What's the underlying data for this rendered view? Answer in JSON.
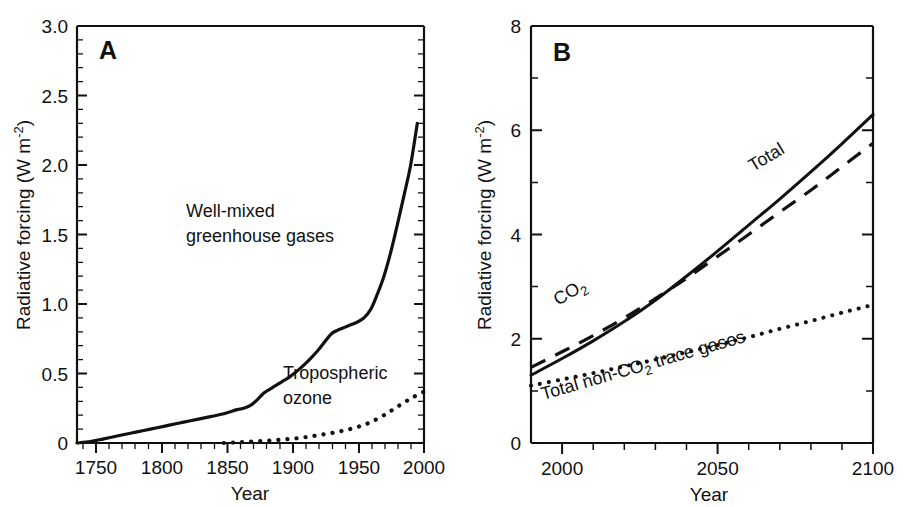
{
  "figure": {
    "background": "#ffffff",
    "ink_color": "#111111",
    "panels": [
      "A",
      "B"
    ]
  },
  "panel_a": {
    "letter": "A",
    "xlabel": "Year",
    "ylabel_main": "Radiative forcing (W m",
    "ylabel_exp": "-2",
    "ylabel_close": ")",
    "ylabel_full": "Radiative forcing (W m-2)",
    "x_ticks": [
      "1750",
      "1800",
      "1850",
      "1900",
      "1950",
      "2000"
    ],
    "y_ticks": [
      "0",
      "0.5",
      "1.0",
      "1.5",
      "2.0",
      "2.5",
      "3.0"
    ],
    "annotations": {
      "ghg_line1": "Well-mixed",
      "ghg_line2": "greenhouse gases",
      "ozone_line1": "Tropospheric",
      "ozone_line2": "ozone"
    }
  },
  "panel_b": {
    "letter": "B",
    "xlabel": "Year",
    "ylabel_main": "Radiative forcing (W m",
    "ylabel_exp": "-2",
    "ylabel_close": ")",
    "ylabel_full": "Radiative forcing (W m-2)",
    "x_ticks": [
      "2000",
      "2050",
      "2100"
    ],
    "y_ticks": [
      "0",
      "2",
      "4",
      "6",
      "8"
    ],
    "annotations": {
      "total": "Total",
      "co2_main": "CO",
      "co2_sub": "2",
      "nonco2_pre": "Total non-CO",
      "nonco2_sub": "2",
      "nonco2_post": " trace gases"
    }
  },
  "chart_data": [
    {
      "type": "line",
      "panel": "A",
      "title": "",
      "xlabel": "Year",
      "ylabel": "Radiative forcing (W m-2)",
      "xlim": [
        1740,
        2000
      ],
      "ylim": [
        0,
        3.0
      ],
      "x_major_ticks": [
        1750,
        1800,
        1850,
        1900,
        1950,
        2000
      ],
      "y_major_ticks": [
        0,
        0.5,
        1.0,
        1.5,
        2.0,
        2.5,
        3.0
      ],
      "x_minor_interval": 10,
      "y_minor_interval": 0.1,
      "grid": false,
      "legend": "inline-annotations",
      "series": [
        {
          "name": "Well-mixed greenhouse gases",
          "style": "solid",
          "x": [
            1740,
            1750,
            1760,
            1770,
            1780,
            1790,
            1800,
            1810,
            1820,
            1830,
            1840,
            1850,
            1860,
            1865,
            1870,
            1875,
            1880,
            1885,
            1890,
            1895,
            1900,
            1910,
            1920,
            1930,
            1935,
            1940,
            1945,
            1950,
            1955,
            1960,
            1965,
            1970,
            1975,
            1980,
            1985,
            1990,
            1995
          ],
          "y": [
            0.0,
            0.01,
            0.03,
            0.05,
            0.07,
            0.09,
            0.11,
            0.13,
            0.15,
            0.17,
            0.19,
            0.21,
            0.24,
            0.25,
            0.27,
            0.31,
            0.36,
            0.39,
            0.42,
            0.45,
            0.48,
            0.56,
            0.66,
            0.78,
            0.81,
            0.83,
            0.85,
            0.87,
            0.9,
            0.96,
            1.07,
            1.2,
            1.37,
            1.57,
            1.78,
            2.0,
            2.3
          ]
        },
        {
          "name": "Tropospheric ozone",
          "style": "dotted",
          "x": [
            1850,
            1860,
            1870,
            1880,
            1890,
            1900,
            1910,
            1920,
            1930,
            1940,
            1950,
            1960,
            1970,
            1980,
            1990,
            2000
          ],
          "y": [
            0.0,
            0.005,
            0.01,
            0.015,
            0.022,
            0.03,
            0.04,
            0.055,
            0.07,
            0.09,
            0.115,
            0.15,
            0.2,
            0.26,
            0.32,
            0.37
          ]
        }
      ]
    },
    {
      "type": "line",
      "panel": "B",
      "title": "",
      "xlabel": "Year",
      "ylabel": "Radiative forcing (W m-2)",
      "xlim": [
        1990,
        2100
      ],
      "ylim": [
        0,
        8
      ],
      "x_major_ticks": [
        2000,
        2050,
        2100
      ],
      "y_major_ticks": [
        0,
        2,
        4,
        6,
        8
      ],
      "x_minor_interval": 10,
      "y_minor_interval": 1,
      "grid": false,
      "legend": "inline-annotations",
      "series": [
        {
          "name": "Total",
          "style": "solid",
          "x": [
            1990,
            2000,
            2010,
            2020,
            2030,
            2040,
            2050,
            2060,
            2070,
            2080,
            2090,
            2100
          ],
          "y": [
            1.3,
            1.62,
            1.96,
            2.33,
            2.74,
            3.2,
            3.68,
            4.18,
            4.68,
            5.2,
            5.74,
            6.3
          ]
        },
        {
          "name": "CO2",
          "style": "dashed",
          "x": [
            1990,
            2000,
            2010,
            2020,
            2030,
            2040,
            2050,
            2060,
            2070,
            2080,
            2090,
            2100
          ],
          "y": [
            1.45,
            1.75,
            2.06,
            2.4,
            2.77,
            3.16,
            3.58,
            4.0,
            4.43,
            4.85,
            5.3,
            5.75
          ]
        },
        {
          "name": "Total non-CO2 trace gases",
          "style": "dotted",
          "x": [
            1990,
            2000,
            2010,
            2020,
            2030,
            2040,
            2050,
            2060,
            2070,
            2080,
            2090,
            2100
          ],
          "y": [
            1.1,
            1.22,
            1.34,
            1.47,
            1.6,
            1.74,
            1.88,
            2.03,
            2.19,
            2.34,
            2.5,
            2.65
          ]
        }
      ]
    }
  ]
}
